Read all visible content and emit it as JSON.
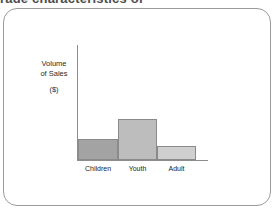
{
  "scan": {
    "header_text": "rage characteristics of",
    "frame_color": "#9a9a9a",
    "background": "#ffffff"
  },
  "chart_data": {
    "type": "bar",
    "title": "",
    "categories": [
      "Children",
      "Youth",
      "Adult"
    ],
    "values": [
      21,
      41,
      14
    ],
    "series": [
      {
        "name": "Volume of Sales ($)",
        "values": [
          21,
          41,
          14
        ]
      }
    ],
    "bar_colors": [
      "#a3a3a3",
      "#bdbdbd",
      "#cfcfcf"
    ],
    "ylabel_lines": [
      "Volume",
      "of  Sales"
    ],
    "ylabel_units": "($)",
    "xlabel": "",
    "ylim": [
      0,
      116
    ],
    "grid": false,
    "legend": "none",
    "axis_color": "#8d8d8d",
    "bars_adjacent": true
  },
  "axis_label": {
    "line1": "Volume",
    "line2": "of  Sales",
    "units": "($)"
  }
}
